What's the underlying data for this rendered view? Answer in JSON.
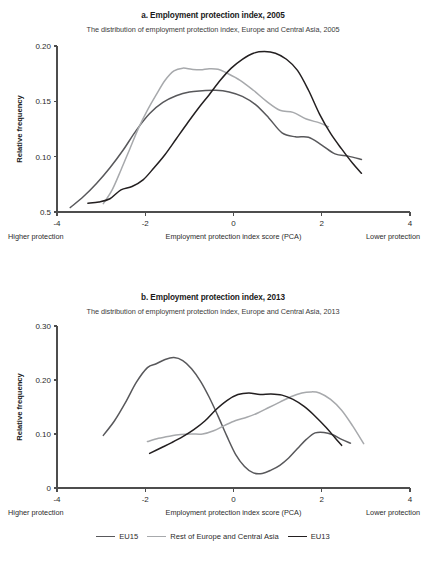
{
  "figure": {
    "legend": {
      "items": [
        {
          "label": "EU15",
          "color": "#58585b"
        },
        {
          "label": "Rest of Europe and Central Asia",
          "color": "#a7a9ac"
        },
        {
          "label": "EU13",
          "color": "#231f20"
        }
      ]
    }
  },
  "chart_data": [
    {
      "type": "line",
      "panel": "a",
      "title": "a. Employment protection index, 2005",
      "subtitle": "The distribution of employment protection index, Europe and Central Asia, 2005",
      "xlabel": "Employment protection index score (PCA)",
      "ylabel": "Relative frequency",
      "xlabel_left": "Higher protection",
      "xlabel_right": "Lower protection",
      "xlim": [
        -4,
        4
      ],
      "ylim": [
        0.05,
        0.2
      ],
      "xticks": [
        -4,
        -2,
        0,
        2,
        4
      ],
      "xticklabels": [
        "-4",
        "-2",
        "0",
        "2",
        "4"
      ],
      "yticks": [
        0.05,
        0.1,
        0.15,
        0.2
      ],
      "yticklabels": [
        "0.5",
        "0.10",
        "0.15",
        "0.20"
      ],
      "grid": false,
      "legend_position": "below-figure",
      "series": [
        {
          "name": "EU15",
          "color": "#58585b",
          "x": [
            -3.7,
            -3.4,
            -3.1,
            -2.8,
            -2.5,
            -2.2,
            -1.9,
            -1.6,
            -1.3,
            -1.0,
            -0.7,
            -0.4,
            -0.1,
            0.2,
            0.5,
            0.8,
            1.1,
            1.4,
            1.7,
            2.0,
            2.3,
            2.6,
            2.9
          ],
          "y": [
            0.054,
            0.064,
            0.076,
            0.09,
            0.106,
            0.124,
            0.139,
            0.149,
            0.155,
            0.1585,
            0.1595,
            0.16,
            0.1585,
            0.1545,
            0.147,
            0.135,
            0.1215,
            0.118,
            0.1175,
            0.1105,
            0.1025,
            0.1005,
            0.0975
          ]
        },
        {
          "name": "Rest of Europe and Central Asia",
          "color": "#a7a9ac",
          "x": [
            -2.95,
            -2.75,
            -2.55,
            -2.35,
            -2.15,
            -1.95,
            -1.75,
            -1.55,
            -1.35,
            -1.15,
            -0.95,
            -0.75,
            -0.55,
            -0.35,
            -0.15,
            0.15,
            0.45,
            0.75,
            1.05,
            1.35,
            1.65,
            1.95,
            2.15
          ],
          "y": [
            0.0575,
            0.07,
            0.088,
            0.107,
            0.126,
            0.142,
            0.156,
            0.169,
            0.1775,
            0.18,
            0.179,
            0.1785,
            0.1795,
            0.179,
            0.1755,
            0.169,
            0.16,
            0.15,
            0.142,
            0.14,
            0.134,
            0.1305,
            0.127
          ]
        },
        {
          "name": "EU13",
          "color": "#231f20",
          "x": [
            -3.3,
            -3.05,
            -2.8,
            -2.55,
            -2.3,
            -2.05,
            -1.8,
            -1.55,
            -1.3,
            -1.05,
            -0.8,
            -0.55,
            -0.3,
            -0.05,
            0.2,
            0.45,
            0.7,
            0.95,
            1.2,
            1.45,
            1.7,
            1.95,
            2.2,
            2.45,
            2.7,
            2.9
          ],
          "y": [
            0.058,
            0.059,
            0.062,
            0.07,
            0.073,
            0.079,
            0.09,
            0.102,
            0.116,
            0.13,
            0.1435,
            0.156,
            0.169,
            0.18,
            0.188,
            0.1935,
            0.195,
            0.1935,
            0.188,
            0.178,
            0.16,
            0.1385,
            0.121,
            0.107,
            0.094,
            0.085
          ]
        }
      ]
    },
    {
      "type": "line",
      "panel": "b",
      "title": "b. Employment protection index, 2013",
      "subtitle": "The distribution of employment protection index, Europe and Central Asia, 2013",
      "xlabel": "Employment protection index score (PCA)",
      "ylabel": "Relative frequency",
      "xlabel_left": "Higher protection",
      "xlabel_right": "Lower protection",
      "xlim": [
        -4,
        4
      ],
      "ylim": [
        0,
        0.3
      ],
      "xticks": [
        -4,
        -2,
        0,
        2,
        4
      ],
      "xticklabels": [
        "-4",
        "-2",
        "0",
        "2",
        "4"
      ],
      "yticks": [
        0,
        0.1,
        0.2,
        0.3
      ],
      "yticklabels": [
        "0",
        "0.10",
        "0.20",
        "0.30"
      ],
      "grid": false,
      "legend_position": "below-figure",
      "series": [
        {
          "name": "EU15",
          "color": "#58585b",
          "x": [
            -2.95,
            -2.7,
            -2.45,
            -2.2,
            -1.95,
            -1.75,
            -1.55,
            -1.35,
            -1.15,
            -0.95,
            -0.75,
            -0.55,
            -0.35,
            -0.15,
            0.05,
            0.25,
            0.45,
            0.65,
            0.85,
            1.05,
            1.25,
            1.45,
            1.65,
            1.85,
            2.05,
            2.25,
            2.45,
            2.65
          ],
          "y": [
            0.0975,
            0.124,
            0.158,
            0.196,
            0.223,
            0.23,
            0.238,
            0.2415,
            0.236,
            0.221,
            0.198,
            0.168,
            0.133,
            0.096,
            0.062,
            0.04,
            0.028,
            0.027,
            0.033,
            0.042,
            0.0555,
            0.073,
            0.09,
            0.102,
            0.103,
            0.0985,
            0.09,
            0.083
          ]
        },
        {
          "name": "Rest of Europe and Central Asia",
          "color": "#a7a9ac",
          "x": [
            -1.95,
            -1.7,
            -1.45,
            -1.2,
            -0.95,
            -0.7,
            -0.45,
            -0.2,
            0.05,
            0.3,
            0.55,
            0.8,
            1.05,
            1.3,
            1.55,
            1.75,
            1.95,
            2.2,
            2.45,
            2.7,
            2.95
          ],
          "y": [
            0.086,
            0.092,
            0.096,
            0.099,
            0.1,
            0.1,
            0.106,
            0.116,
            0.125,
            0.131,
            0.139,
            0.149,
            0.159,
            0.169,
            0.176,
            0.178,
            0.176,
            0.164,
            0.144,
            0.115,
            0.082
          ]
        },
        {
          "name": "EU13",
          "color": "#231f20",
          "x": [
            -1.9,
            -1.65,
            -1.4,
            -1.15,
            -0.9,
            -0.65,
            -0.4,
            -0.15,
            0.1,
            0.35,
            0.6,
            0.85,
            1.1,
            1.35,
            1.6,
            1.85,
            2.1,
            2.3,
            2.45
          ],
          "y": [
            0.064,
            0.074,
            0.084,
            0.095,
            0.108,
            0.124,
            0.145,
            0.162,
            0.173,
            0.176,
            0.173,
            0.174,
            0.172,
            0.164,
            0.151,
            0.133,
            0.112,
            0.093,
            0.079
          ]
        }
      ]
    }
  ]
}
